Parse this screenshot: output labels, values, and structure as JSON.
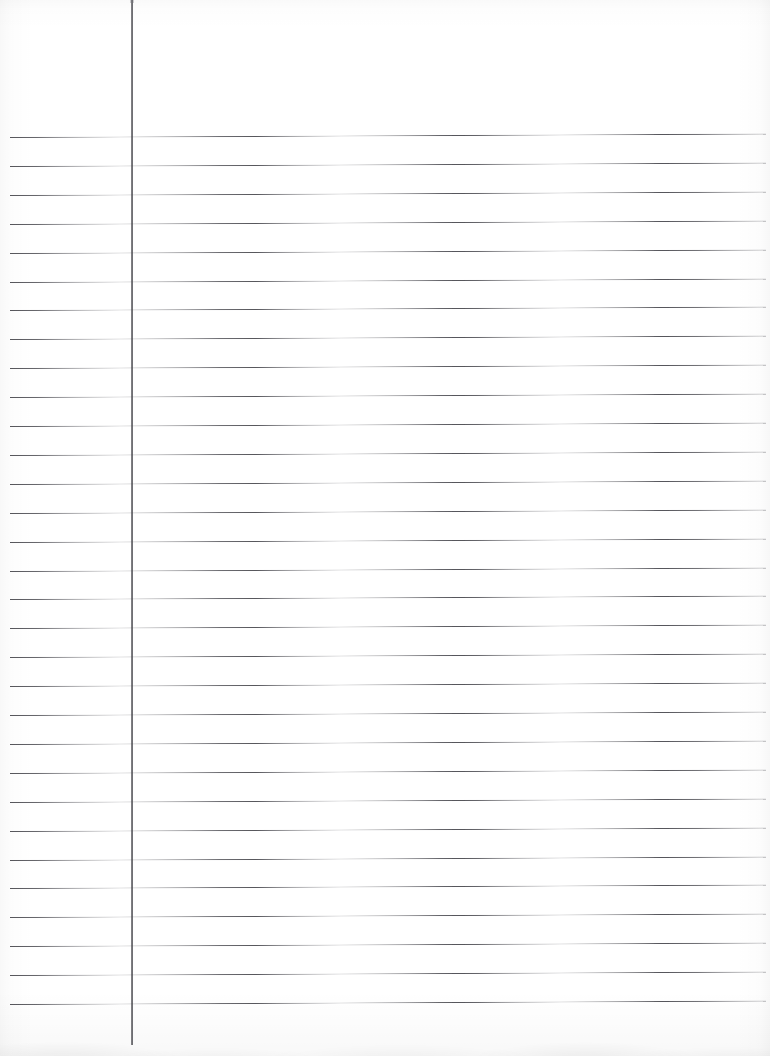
{
  "document": {
    "kind": "scanned-ruled-notebook-paper",
    "title": "Blank ruled notebook page",
    "orientation": "portrait",
    "width_px": 770,
    "height_px": 1056,
    "page_text": "",
    "handwriting_present": false
  },
  "colors": {
    "paper": "#ffffff",
    "rule_line": "#48484e",
    "margin_rule": "#3a3a40",
    "edge_shadow": "#000000"
  },
  "margin_rule": {
    "label": "vertical margin rule",
    "x_px": 131,
    "top_px": 0,
    "bottom_px": 1045,
    "thickness_px": 1.6,
    "color": "#3a3a40"
  },
  "ruling": {
    "label": "horizontal ruled lines",
    "style": "wide ruled",
    "first_line_y_px": 137,
    "spacing_px": 28.9,
    "line_count": 31,
    "left_x_px": 10,
    "right_x_px": 766,
    "thickness_px": 1.1,
    "tilt_deg": -0.26,
    "color": "#48484e",
    "line_y_positions": [
      137.0,
      165.9,
      194.8,
      223.7,
      252.6,
      281.5,
      310.4,
      339.3,
      368.2,
      397.1,
      426.0,
      454.9,
      483.8,
      512.7,
      541.6,
      570.5,
      599.4,
      628.3,
      657.2,
      686.1,
      715.0,
      743.9,
      772.8,
      801.7,
      830.6,
      859.5,
      888.4,
      917.3,
      946.2,
      975.1,
      1004.0
    ]
  },
  "regions": {
    "header_area_label": "unruled header area above first line",
    "margin_area_label": "left margin column",
    "writing_area_label": "main writing area"
  }
}
